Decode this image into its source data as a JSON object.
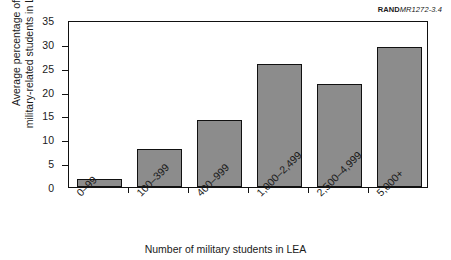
{
  "credit": {
    "organization": "RAND",
    "document": "MR1272-3.4"
  },
  "chart_data": {
    "type": "bar",
    "title": "",
    "categories": [
      "0–99",
      "100–399",
      "400–999",
      "1,000–2,499",
      "2,500–4,999",
      "5,000+"
    ],
    "values": [
      1.7,
      7.9,
      14.0,
      25.8,
      21.5,
      29.3
    ],
    "xlabel": "Number of military students in LEA",
    "ylabel_line1": "Average percentage of",
    "ylabel_line2": "military-related students in LEAs",
    "ylim": [
      0,
      35
    ],
    "yticks": [
      0,
      5,
      10,
      15,
      20,
      25,
      30,
      35
    ],
    "ytick_labels": [
      "0",
      "5",
      "10",
      "15",
      "20",
      "25",
      "30",
      "35"
    ],
    "grid": false,
    "legend": null,
    "bar_fill_color": "#8c8c8c",
    "bar_edge_color": "#111111",
    "background_color": "#ffffff"
  }
}
